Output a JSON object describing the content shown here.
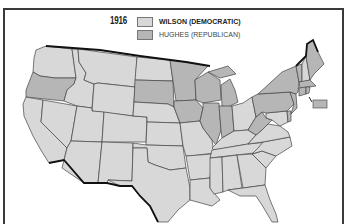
{
  "map": {
    "title_year": "1916",
    "legend": [
      {
        "label": "WILSON (DEMOCRATIC)",
        "color": "#d8d8d8"
      },
      {
        "label": "HUGHES (REPUBLICAN)",
        "color": "#b6b6b6"
      }
    ],
    "colors": {
      "democratic": "#d8d8d8",
      "republican": "#b6b6b6",
      "border": "#444444",
      "national_border": "#111111",
      "frame": "#3a3a3a"
    },
    "states_republican": [
      "Oregon",
      "South Dakota",
      "Minnesota",
      "Wisconsin",
      "Michigan",
      "Iowa",
      "Illinois",
      "Indiana",
      "Pennsylvania",
      "New York",
      "New Jersey",
      "Delaware",
      "West Virginia",
      "Connecticut",
      "Rhode Island",
      "Massachusetts",
      "Vermont",
      "Maine"
    ],
    "states_democratic": [
      "Washington",
      "California",
      "Idaho",
      "Nevada",
      "Utah",
      "Arizona",
      "Montana",
      "Wyoming",
      "Colorado",
      "New Mexico",
      "North Dakota",
      "Nebraska",
      "Kansas",
      "Oklahoma",
      "Texas",
      "Missouri",
      "Arkansas",
      "Louisiana",
      "Mississippi",
      "Alabama",
      "Tennessee",
      "Kentucky",
      "Ohio",
      "Georgia",
      "Florida",
      "South Carolina",
      "North Carolina",
      "Virginia",
      "Maryland",
      "New Hampshire"
    ]
  }
}
